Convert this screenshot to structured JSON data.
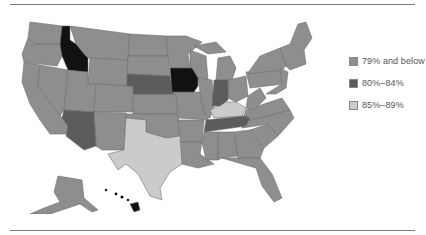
{
  "legend": {
    "items": [
      {
        "label": "79% and below",
        "color": "#8e8e8e"
      },
      {
        "label": "80%–84%",
        "color": "#5c5c5c"
      },
      {
        "label": "85%–89%",
        "color": "#cbcbcb"
      }
    ]
  },
  "colors": {
    "low": "#8e8e8e",
    "mid": "#5c5c5c",
    "high": "#cbcbcb",
    "top": "#111111",
    "border": "#6e6e6e",
    "rule": "#7a7a7a"
  },
  "states": {
    "idaho": "top",
    "iowa": "top",
    "hawaii": "top",
    "nebraska": "mid",
    "arizona": "mid",
    "indiana": "mid",
    "tennessee": "mid",
    "texas": "high",
    "kentucky": "high",
    "other": "low"
  }
}
